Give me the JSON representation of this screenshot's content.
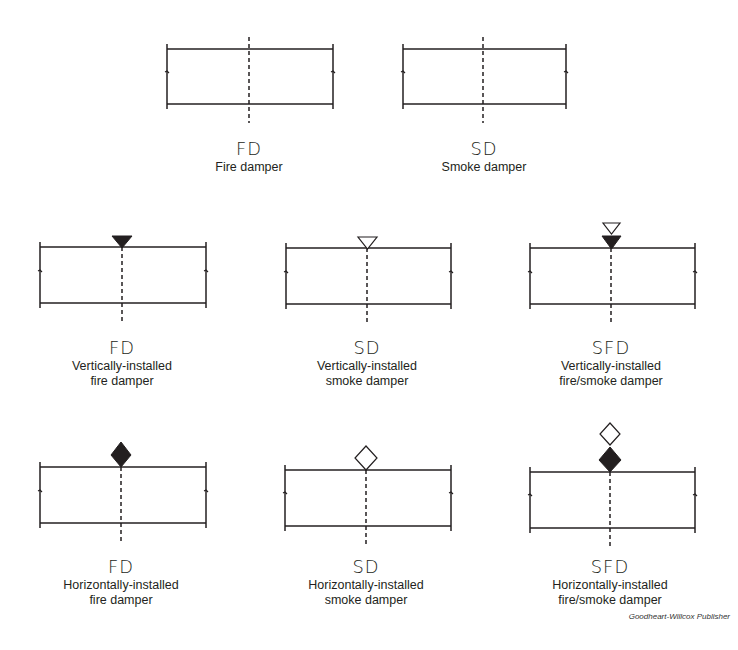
{
  "diagram": {
    "type": "HVAC damper symbols",
    "stroke_color": "#231f20",
    "symbols": [
      {
        "id": "fd-plain",
        "abbr": "FD",
        "desc_line1": "Fire damper",
        "desc_line2": "",
        "marker": "none"
      },
      {
        "id": "sd-plain",
        "abbr": "SD",
        "desc_line1": "Smoke damper",
        "desc_line2": "",
        "marker": "none"
      },
      {
        "id": "fd-vertical",
        "abbr": "FD",
        "desc_line1": "Vertically-installed",
        "desc_line2": "fire damper",
        "marker": "filled-triangle"
      },
      {
        "id": "sd-vertical",
        "abbr": "SD",
        "desc_line1": "Vertically-installed",
        "desc_line2": "smoke damper",
        "marker": "open-triangle"
      },
      {
        "id": "sfd-vertical",
        "abbr": "SFD",
        "desc_line1": "Vertically-installed",
        "desc_line2": "fire/smoke damper",
        "marker": "open-triangle-over-filled-triangle"
      },
      {
        "id": "fd-horizontal",
        "abbr": "FD",
        "desc_line1": "Horizontally-installed",
        "desc_line2": "fire damper",
        "marker": "filled-diamond"
      },
      {
        "id": "sd-horizontal",
        "abbr": "SD",
        "desc_line1": "Horizontally-installed",
        "desc_line2": "smoke damper",
        "marker": "open-diamond"
      },
      {
        "id": "sfd-horizontal",
        "abbr": "SFD",
        "desc_line1": "Horizontally-installed",
        "desc_line2": "fire/smoke damper",
        "marker": "open-diamond-over-filled-diamond"
      }
    ]
  },
  "credit": "Goodheart-Willcox Publisher"
}
